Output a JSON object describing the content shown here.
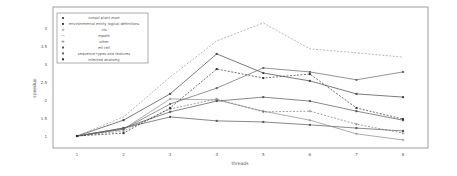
{
  "chart_data": {
    "type": "line",
    "title": "",
    "xlabel": "threads",
    "ylabel": "speedup",
    "x": [
      1,
      2,
      3,
      4,
      5,
      6,
      7,
      8
    ],
    "xticks": [
      "1",
      "2",
      "3",
      "4",
      "5",
      "6",
      "7",
      "8"
    ],
    "yticks": [
      "1",
      "1.5",
      "2",
      "2.5",
      "3",
      "3.5",
      "4"
    ],
    "ylim": [
      0.7,
      4.3
    ],
    "xlim": [
      0.4,
      8.4
    ],
    "grid": false,
    "legend_position": "upper-left",
    "series": [
      {
        "name": "consol plant mart",
        "values": [
          1,
          1.22,
          1.53,
          1.42,
          1.39,
          1.31,
          1.22,
          1.14
        ],
        "color": "#555555",
        "dash": "",
        "marker": "square"
      },
      {
        "name": "environmental entity logical definitions",
        "values": [
          1,
          1.44,
          2.17,
          3.28,
          2.75,
          2.53,
          2.17,
          2.08
        ],
        "color": "#444444",
        "dash": "",
        "marker": "square"
      },
      {
        "name": "cfs",
        "values": [
          1,
          1.19,
          2.03,
          2.0,
          1.69,
          1.44,
          1.06,
          0.89
        ],
        "color": "#888888",
        "dash": "",
        "marker": "plus"
      },
      {
        "name": "mpath",
        "values": [
          1,
          1.53,
          2.64,
          3.64,
          4.14,
          3.42,
          3.31,
          3.19
        ],
        "color": "#999999",
        "dash": "2,1.5",
        "marker": "none"
      },
      {
        "name": "other",
        "values": [
          1,
          1.14,
          1.75,
          2.03,
          1.67,
          1.69,
          1.33,
          1.08
        ],
        "color": "#777777",
        "dash": "2,1.5",
        "marker": "plus"
      },
      {
        "name": "mf cell",
        "values": [
          1,
          1.22,
          1.67,
          1.97,
          2.08,
          1.97,
          1.69,
          1.44
        ],
        "color": "#555555",
        "dash": "",
        "marker": "square"
      },
      {
        "name": "sequence types and features",
        "values": [
          1,
          1.19,
          1.89,
          2.33,
          2.89,
          2.78,
          2.56,
          2.78
        ],
        "color": "#666666",
        "dash": "",
        "marker": "square"
      },
      {
        "name": "infected anatomy",
        "values": [
          1,
          1.08,
          1.78,
          2.86,
          2.61,
          2.72,
          1.78,
          1.47
        ],
        "color": "#333333",
        "dash": "2,1.5",
        "marker": "square"
      }
    ]
  }
}
